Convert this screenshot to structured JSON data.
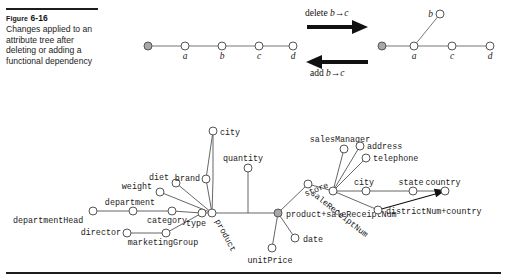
{
  "figure": {
    "label_small_caps": "Figure",
    "label_number": "6-16",
    "caption": "Changes applied to an attribute tree after deleting or adding a functional dependency"
  },
  "transform": {
    "delete_label": "delete",
    "delete_dep": "b→c",
    "add_label": "add",
    "add_dep": "b→c"
  },
  "left_tree": {
    "title": "attribute tree before change",
    "root": {
      "label": "",
      "x": 148,
      "y": 46,
      "root": true
    },
    "nodes": [
      {
        "label": "a",
        "x": 185,
        "y": 46
      },
      {
        "label": "b",
        "x": 222,
        "y": 46
      },
      {
        "label": "c",
        "x": 259,
        "y": 46
      },
      {
        "label": "d",
        "x": 293,
        "y": 46
      }
    ],
    "edges": [
      [
        148,
        46,
        185,
        46
      ],
      [
        185,
        46,
        222,
        46
      ],
      [
        222,
        46,
        259,
        46
      ],
      [
        259,
        46,
        293,
        46
      ]
    ]
  },
  "right_tree": {
    "title": "attribute tree after change",
    "root": {
      "label": "",
      "x": 382,
      "y": 46,
      "root": true
    },
    "nodes": [
      {
        "label": "a",
        "x": 414,
        "y": 46
      },
      {
        "label": "b",
        "x": 440,
        "y": 14
      },
      {
        "label": "c",
        "x": 452,
        "y": 46
      },
      {
        "label": "d",
        "x": 490,
        "y": 46
      }
    ],
    "edges": [
      [
        382,
        46,
        414,
        46
      ],
      [
        414,
        46,
        440,
        14
      ],
      [
        414,
        46,
        452,
        46
      ],
      [
        452,
        46,
        490,
        46
      ]
    ]
  },
  "attribute_tree": {
    "root_node": "product+saleReceiptNum",
    "nodes": [
      {
        "name": "departmentHead",
        "x": 93,
        "y": 211,
        "label_dx": -80,
        "label_dy": 12,
        "anchor": "start",
        "rot": 0
      },
      {
        "name": "department",
        "x": 133,
        "y": 211,
        "label_dx": -3,
        "label_dy": -6,
        "anchor": "middle",
        "rot": 0
      },
      {
        "name": "category",
        "x": 172,
        "y": 211,
        "label_dx": -5,
        "label_dy": 12,
        "anchor": "middle",
        "rot": 0
      },
      {
        "name": "director",
        "x": 127,
        "y": 233,
        "label_dx": -6,
        "label_dy": 2,
        "anchor": "end",
        "rot": 0
      },
      {
        "name": "marketingGroup",
        "x": 166,
        "y": 233,
        "label_dx": -3,
        "label_dy": 12,
        "anchor": "middle",
        "rot": 0
      },
      {
        "name": "type",
        "x": 202,
        "y": 213,
        "label_dx": -6,
        "label_dy": 13,
        "anchor": "middle",
        "rot": 0
      },
      {
        "name": "weight",
        "x": 160,
        "y": 192,
        "label_dx": -8,
        "label_dy": -3,
        "anchor": "end",
        "rot": 0
      },
      {
        "name": "diet",
        "x": 176,
        "y": 183,
        "label_dx": -7,
        "label_dy": -3,
        "anchor": "end",
        "rot": 0
      },
      {
        "name": "brand",
        "x": 206,
        "y": 179,
        "label_dx": -6,
        "label_dy": 2,
        "anchor": "end",
        "rot": 0
      },
      {
        "name": "city",
        "x": 213,
        "y": 131,
        "label_dx": 7,
        "label_dy": 4,
        "anchor": "start",
        "rot": 0
      },
      {
        "name": "product",
        "x": 212,
        "y": 213,
        "label_dx": 3,
        "label_dy": 8,
        "anchor": "start",
        "rot": 62
      },
      {
        "name": "quantity",
        "x": 248,
        "y": 168,
        "label_dx": -5,
        "label_dy": -7,
        "anchor": "middle",
        "rot": 0
      },
      {
        "name": "product+saleReceiptNum",
        "x": 278,
        "y": 213,
        "label_dx": 8,
        "label_dy": 4,
        "anchor": "start",
        "rot": 0,
        "root": true
      },
      {
        "name": "date",
        "x": 295,
        "y": 238,
        "label_dx": 8,
        "label_dy": 4,
        "anchor": "start",
        "rot": 0
      },
      {
        "name": "unitPrice",
        "x": 272,
        "y": 248,
        "label_dx": -2,
        "label_dy": 15,
        "anchor": "middle",
        "rot": 0
      },
      {
        "name": "saleReceiptNum",
        "x": 308,
        "y": 184,
        "label_dx": 2,
        "label_dy": 10,
        "anchor": "start",
        "rot": 38
      },
      {
        "name": "store",
        "x": 333,
        "y": 191,
        "label_dx": -4,
        "label_dy": -4,
        "anchor": "end",
        "rot": -22
      },
      {
        "name": "salesManager",
        "x": 344,
        "y": 149,
        "label_dx": -4,
        "label_dy": -7,
        "anchor": "middle",
        "rot": 0
      },
      {
        "name": "address",
        "x": 360,
        "y": 146,
        "label_dx": 7,
        "label_dy": 3,
        "anchor": "start",
        "rot": 0
      },
      {
        "name": "telephone",
        "x": 366,
        "y": 158,
        "label_dx": 7,
        "label_dy": 3,
        "anchor": "start",
        "rot": 0
      },
      {
        "name": "city",
        "x": 366,
        "y": 191,
        "label_dx": -2,
        "label_dy": -6,
        "anchor": "middle",
        "rot": 0
      },
      {
        "name": "state",
        "x": 413,
        "y": 191,
        "label_dx": -2,
        "label_dy": -6,
        "anchor": "middle",
        "rot": 0
      },
      {
        "name": "country",
        "x": 445,
        "y": 191,
        "label_dx": -2,
        "label_dy": -6,
        "anchor": "middle",
        "rot": 0
      },
      {
        "name": "districtNum+country",
        "x": 378,
        "y": 210,
        "label_dx": 8,
        "label_dy": 4,
        "anchor": "start",
        "rot": 0
      }
    ],
    "edges": [
      [
        93,
        211,
        133,
        211
      ],
      [
        133,
        211,
        172,
        211
      ],
      [
        172,
        211,
        202,
        213
      ],
      [
        127,
        233,
        166,
        233
      ],
      [
        166,
        233,
        202,
        213
      ],
      [
        202,
        213,
        212,
        213
      ],
      [
        160,
        192,
        212,
        213
      ],
      [
        176,
        183,
        212,
        213
      ],
      [
        206,
        179,
        212,
        213
      ],
      [
        206,
        179,
        213,
        131
      ],
      [
        213,
        131,
        213,
        179
      ],
      [
        212,
        213,
        213,
        179
      ],
      [
        212,
        213,
        278,
        213
      ],
      [
        248,
        168,
        248,
        213
      ],
      [
        278,
        213,
        295,
        238
      ],
      [
        278,
        213,
        272,
        248
      ],
      [
        278,
        213,
        308,
        184
      ],
      [
        308,
        184,
        333,
        191
      ],
      [
        333,
        191,
        344,
        149
      ],
      [
        333,
        191,
        360,
        146
      ],
      [
        333,
        191,
        366,
        158
      ],
      [
        333,
        191,
        366,
        191
      ],
      [
        366,
        191,
        413,
        191
      ],
      [
        413,
        191,
        445,
        191
      ],
      [
        333,
        191,
        378,
        210
      ]
    ],
    "arrow_edge": {
      "from": [
        378,
        210
      ],
      "to": [
        445,
        191
      ],
      "label": "districtNum+country"
    }
  }
}
